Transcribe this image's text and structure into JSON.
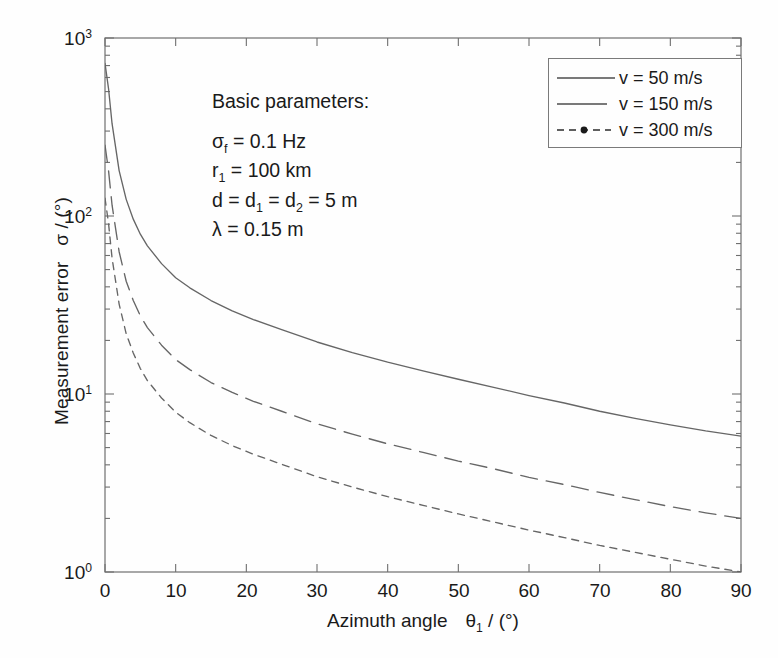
{
  "figure": {
    "background_color": "#fefefe",
    "ink_color": "#4d4d4d",
    "text_color": "#1a1a1a"
  },
  "axis": {
    "x_label_main": "Azimuth angle",
    "x_label_symbol": "θ",
    "x_label_sub": "1",
    "x_label_unit": " / (°)",
    "y_label_main": "Measurement error",
    "y_label_symbol": "σ",
    "y_label_unit": " / (°)",
    "x_ticks": [
      "0",
      "10",
      "20",
      "30",
      "40",
      "50",
      "60",
      "70",
      "80",
      "90"
    ],
    "y_ticks": [
      "10",
      "10",
      "10",
      "10"
    ],
    "y_tick_exponents": [
      "0",
      "1",
      "2",
      "3"
    ]
  },
  "annotation": {
    "heading": "Basic parameters:",
    "lines": [
      {
        "lead": "σ",
        "sub": "f",
        "rest": " = 0.1 Hz"
      },
      {
        "lead": "r",
        "sub": "1",
        "rest": " = 100 km"
      },
      {
        "lead": "d = d",
        "sub": "1",
        "rest": " = d",
        "sub2": "2",
        "rest2": " = 5 m"
      },
      {
        "lead": "λ",
        "sub": "",
        "rest": " = 0.15 m"
      }
    ]
  },
  "legend": {
    "position": "top-right",
    "entries": [
      {
        "label": "v = 50 m/s",
        "style": "solid",
        "marker": "none"
      },
      {
        "label": "v = 150 m/s",
        "style": "long-dash",
        "marker": "none"
      },
      {
        "label": "v = 300 m/s",
        "style": "short-dash",
        "marker": "dot"
      }
    ]
  },
  "chart_data": {
    "type": "line",
    "title": "",
    "xlabel": "Azimuth angle θ₁ / (°)",
    "ylabel": "Measurement error σ / (°)",
    "xlim": [
      0,
      90
    ],
    "ylim": [
      1,
      1000
    ],
    "yscale": "log",
    "xscale": "linear",
    "grid": false,
    "legend_position": "upper right",
    "x": [
      0,
      0.5,
      1,
      2,
      3,
      4,
      5,
      6,
      8,
      10,
      12,
      15,
      18,
      21,
      25,
      30,
      35,
      40,
      45,
      50,
      55,
      60,
      65,
      70,
      75,
      80,
      85,
      90
    ],
    "series": [
      {
        "name": "v = 50 m/s",
        "style": "solid",
        "values": [
          720,
          520,
          330,
          180,
          124,
          96,
          79,
          68,
          54,
          45,
          39.5,
          33.5,
          29.3,
          26.2,
          23.0,
          19.6,
          17.1,
          15.1,
          13.5,
          12.1,
          10.9,
          9.8,
          8.9,
          8.0,
          7.3,
          6.7,
          6.2,
          5.8
        ]
      },
      {
        "name": "v = 150 m/s",
        "style": "long-dash",
        "values": [
          250,
          180,
          115,
          63,
          43,
          33.5,
          27.5,
          23.6,
          18.8,
          15.6,
          13.7,
          11.6,
          10.2,
          9.1,
          8.0,
          6.8,
          5.95,
          5.25,
          4.7,
          4.2,
          3.8,
          3.4,
          3.1,
          2.8,
          2.55,
          2.33,
          2.15,
          2.0
        ]
      },
      {
        "name": "v = 300 m/s",
        "style": "short-dash",
        "values": [
          126,
          91,
          58,
          32,
          21.8,
          17.0,
          13.9,
          11.9,
          9.5,
          7.9,
          6.9,
          5.85,
          5.13,
          4.59,
          4.03,
          3.43,
          3.0,
          2.65,
          2.37,
          2.12,
          1.91,
          1.72,
          1.56,
          1.41,
          1.29,
          1.18,
          1.08,
          1.0
        ]
      }
    ]
  }
}
